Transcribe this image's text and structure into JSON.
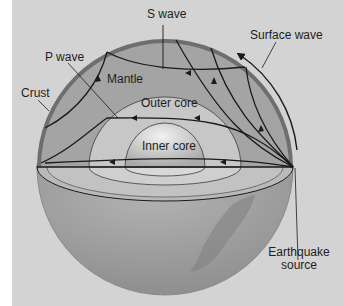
{
  "figure": {
    "colors": {
      "background": "#d3d3d3",
      "margin": "#ffffff",
      "crust": "#6e6e6e",
      "mantle": "#a4a4a4",
      "outer_core": "#c4c4c4",
      "inner_core": "#d8d8d8",
      "lower_hemisphere": "#9a9a9a",
      "wave_lines": "#1a1a1a"
    },
    "labels": {
      "s_wave": "S wave",
      "p_wave": "P wave",
      "surface_wave": "Surface wave",
      "crust": "Crust",
      "mantle": "Mantle",
      "outer_core": "Outer core",
      "inner_core": "Inner core",
      "earthquake_source_line1": "Earthquake",
      "earthquake_source_line2": "source"
    }
  }
}
